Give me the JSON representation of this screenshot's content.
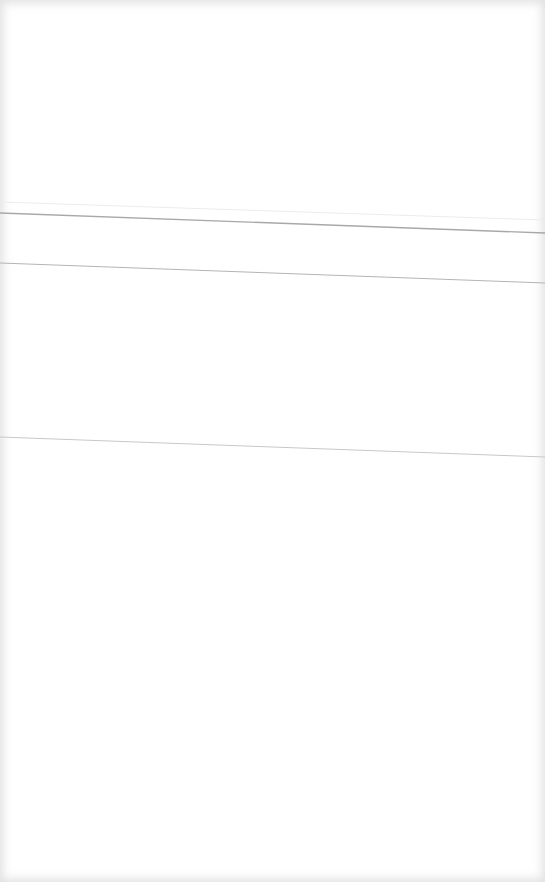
{
  "page": {
    "background": "#ffffff",
    "edge_shade": "#ececec"
  },
  "rules": [
    {
      "x1": 0,
      "y1": 213,
      "x2": 545,
      "y2": 233,
      "stroke": "#a8a8a8",
      "width": 1.4
    },
    {
      "x1": 0,
      "y1": 202,
      "x2": 545,
      "y2": 220,
      "stroke": "#ececec",
      "width": 1
    },
    {
      "x1": 0,
      "y1": 263,
      "x2": 545,
      "y2": 283,
      "stroke": "#b4b4b4",
      "width": 1
    },
    {
      "x1": 0,
      "y1": 437,
      "x2": 545,
      "y2": 457,
      "stroke": "#c8c8c8",
      "width": 1
    }
  ]
}
